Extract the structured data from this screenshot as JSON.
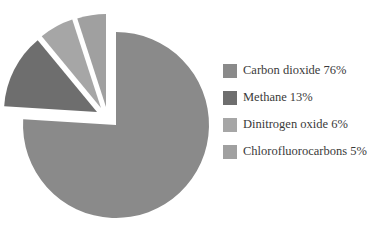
{
  "chart_data": {
    "type": "pie",
    "title": "",
    "categories": [
      "Carbon dioxide",
      "Methane",
      "Dinitrogen oxide",
      "Chlorofluorocarbons"
    ],
    "values": [
      76,
      13,
      6,
      5
    ],
    "unit": "%",
    "colors": [
      "#8a8a8a",
      "#6e6e6e",
      "#a6a6a6",
      "#a0a0a0"
    ],
    "exploded": [
      false,
      true,
      true,
      true
    ],
    "start_angle": "12 o'clock, clockwise",
    "legend_position": "right"
  },
  "legend": {
    "items": [
      {
        "label": "Carbon dioxide 76%",
        "color": "#8a8a8a"
      },
      {
        "label": "Methane 13%",
        "color": "#6e6e6e"
      },
      {
        "label": "Dinitrogen oxide 6%",
        "color": "#a6a6a6"
      },
      {
        "label": "Chlorofluorocarbons 5%",
        "color": "#a0a0a0"
      }
    ]
  }
}
